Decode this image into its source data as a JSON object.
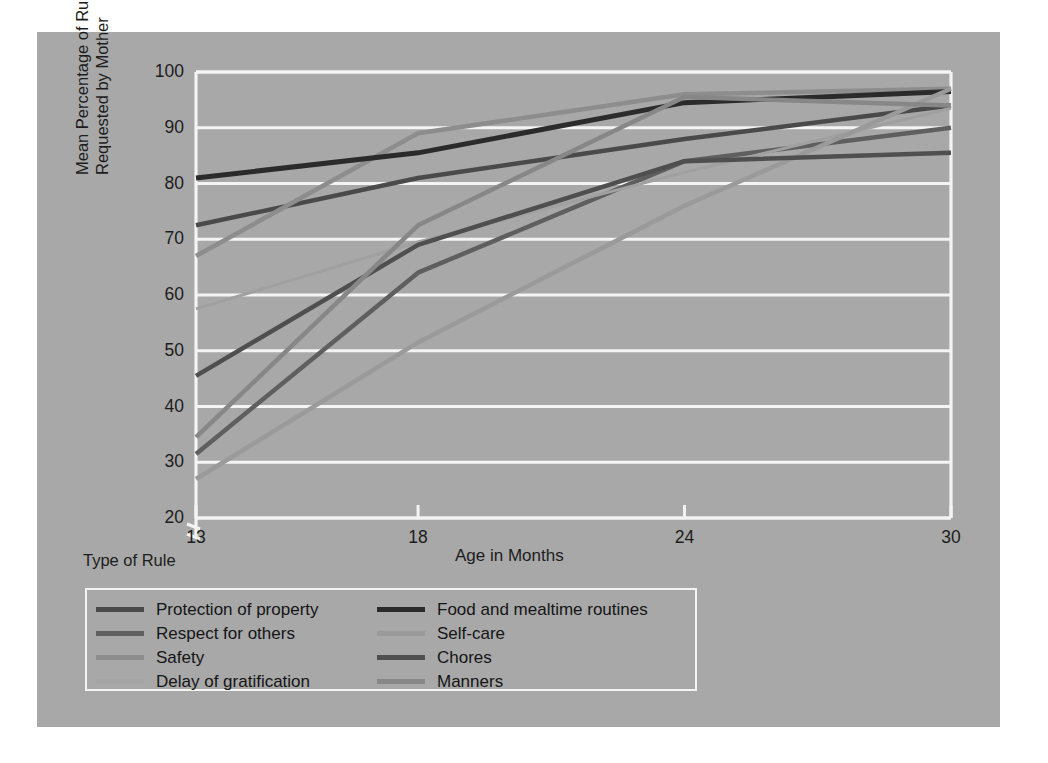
{
  "figure": {
    "panel_bg": "#a8a8a8",
    "frame_color": "#f4f4f4",
    "legend_title": "Type of Rule"
  },
  "chart_data": {
    "type": "line",
    "title": "",
    "xlabel": "Age in Months",
    "ylabel": "Mean Percentage of Rules\nRequested by Mother",
    "x": [
      13,
      18,
      24,
      30
    ],
    "xticks": [
      "13",
      "18",
      "24",
      "30"
    ],
    "yticks": [
      "20",
      "30",
      "40",
      "50",
      "60",
      "70",
      "80",
      "90",
      "100"
    ],
    "ylim": [
      20,
      100
    ],
    "xlim": [
      13,
      30
    ],
    "grid": true,
    "grid_color": "#f4f4f4",
    "axis_break": true,
    "legend_position": "below-left",
    "series": [
      {
        "name": "Protection of property",
        "color": "#4a4a4a",
        "width": 4.5,
        "values": [
          72.5,
          81.0,
          88.0,
          94.0
        ]
      },
      {
        "name": "Respect for others",
        "color": "#5f5f5f",
        "width": 4.5,
        "values": [
          31.5,
          64.0,
          84.0,
          90.0
        ]
      },
      {
        "name": "Safety",
        "color": "#8d8d8d",
        "width": 4.5,
        "values": [
          67.0,
          89.0,
          96.0,
          97.0
        ]
      },
      {
        "name": "Delay of gratification",
        "color": "#a0a0a0",
        "width": 3.0,
        "values": [
          57.5,
          69.5,
          82.0,
          93.5
        ]
      },
      {
        "name": "Food and mealtime routines",
        "color": "#2b2b2b",
        "width": 5.0,
        "values": [
          81.0,
          85.5,
          94.5,
          96.5
        ]
      },
      {
        "name": "Self-care",
        "color": "#9a9a9a",
        "width": 4.5,
        "values": [
          27.0,
          51.5,
          76.0,
          97.0
        ]
      },
      {
        "name": "Chores",
        "color": "#4f4f4f",
        "width": 4.5,
        "values": [
          45.5,
          69.0,
          84.0,
          85.5
        ]
      },
      {
        "name": "Manners",
        "color": "#878787",
        "width": 4.5,
        "values": [
          34.5,
          72.5,
          95.5,
          94.0
        ]
      }
    ]
  },
  "legend": {
    "left_column": [
      {
        "label": "Protection of property",
        "color": "#4a4a4a"
      },
      {
        "label": "Respect for others",
        "color": "#5f5f5f"
      },
      {
        "label": "Safety",
        "color": "#8d8d8d"
      },
      {
        "label": "Delay of gratification",
        "color": "#a4a4a4"
      }
    ],
    "right_column": [
      {
        "label": "Food and mealtime routines",
        "color": "#2b2b2b"
      },
      {
        "label": "Self-care",
        "color": "#9a9a9a"
      },
      {
        "label": "Chores",
        "color": "#4f4f4f"
      },
      {
        "label": "Manners",
        "color": "#878787"
      }
    ]
  }
}
